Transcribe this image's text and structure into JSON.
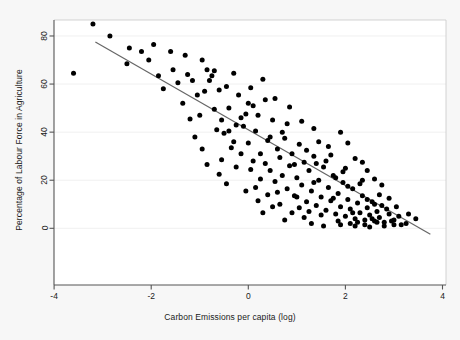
{
  "figure": {
    "background_color": "#f7f7f7",
    "plot_background_color": "#ffffff",
    "frame_color": "#555555",
    "point_color": "#000000",
    "line_color": "#666666",
    "gridline_color": "#f0f0f0"
  },
  "chart_data": {
    "type": "scatter",
    "title": "",
    "xlabel": "Carbon Emissions per capita (log)",
    "ylabel": "Percentage of Labour Force in Agriculture",
    "xlim": [
      -4.3,
      4.2
    ],
    "ylim": [
      -7,
      90
    ],
    "xticks": [
      -4,
      -2,
      0,
      2,
      4
    ],
    "xticklabels": [
      "-4",
      "-2",
      "0",
      "2",
      "4"
    ],
    "yticks": [
      0,
      20,
      40,
      60,
      80
    ],
    "yticklabels": [
      "0",
      "20",
      "40",
      "60",
      "80"
    ],
    "grid": "faint-horizontal",
    "legend": "none",
    "fit_line": {
      "type": "linear",
      "x": [
        -3.15,
        3.75
      ],
      "y": [
        77.5,
        -2.5
      ],
      "slope": -11.6,
      "intercept": 41.0
    },
    "points": [
      [
        -3.6,
        64.5
      ],
      [
        -3.2,
        85.0
      ],
      [
        -2.85,
        80.0
      ],
      [
        -2.45,
        75.0
      ],
      [
        -2.2,
        73.5
      ],
      [
        -2.05,
        70.0
      ],
      [
        -1.95,
        76.5
      ],
      [
        -1.85,
        63.5
      ],
      [
        -1.6,
        73.5
      ],
      [
        -1.55,
        66.0
      ],
      [
        -1.45,
        60.5
      ],
      [
        -1.3,
        72.0
      ],
      [
        -1.25,
        64.0
      ],
      [
        -1.15,
        61.5
      ],
      [
        -1.05,
        55.5
      ],
      [
        -0.95,
        70.0
      ],
      [
        -0.9,
        57.0
      ],
      [
        -0.85,
        66.0
      ],
      [
        -0.8,
        61.5
      ],
      [
        -0.75,
        63.5
      ],
      [
        -0.7,
        49.5
      ],
      [
        -0.65,
        41.0
      ],
      [
        -0.6,
        57.5
      ],
      [
        -0.55,
        45.0
      ],
      [
        -0.5,
        39.5
      ],
      [
        -0.45,
        59.0
      ],
      [
        -0.4,
        40.5
      ],
      [
        -0.35,
        33.5
      ],
      [
        -0.3,
        64.5
      ],
      [
        -0.25,
        43.0
      ],
      [
        -0.2,
        55.5
      ],
      [
        -0.15,
        31.0
      ],
      [
        -0.1,
        42.5
      ],
      [
        -0.05,
        47.5
      ],
      [
        0.0,
        35.5
      ],
      [
        0.05,
        58.5
      ],
      [
        0.1,
        28.0
      ],
      [
        0.15,
        40.5
      ],
      [
        0.2,
        47.0
      ],
      [
        0.25,
        31.0
      ],
      [
        0.3,
        62.0
      ],
      [
        0.35,
        27.0
      ],
      [
        0.4,
        36.5
      ],
      [
        0.45,
        24.0
      ],
      [
        0.5,
        45.0
      ],
      [
        0.55,
        19.5
      ],
      [
        0.6,
        33.0
      ],
      [
        0.65,
        29.5
      ],
      [
        0.7,
        22.0
      ],
      [
        0.75,
        37.5
      ],
      [
        0.8,
        16.5
      ],
      [
        0.85,
        26.0
      ],
      [
        0.9,
        31.0
      ],
      [
        0.95,
        13.5
      ],
      [
        1.0,
        21.0
      ],
      [
        1.05,
        35.0
      ],
      [
        1.1,
        18.0
      ],
      [
        1.15,
        27.5
      ],
      [
        1.2,
        11.0
      ],
      [
        1.25,
        24.0
      ],
      [
        1.3,
        15.5
      ],
      [
        1.35,
        30.0
      ],
      [
        1.4,
        9.5
      ],
      [
        1.45,
        20.0
      ],
      [
        1.5,
        13.0
      ],
      [
        1.55,
        25.5
      ],
      [
        1.6,
        7.5
      ],
      [
        1.65,
        17.0
      ],
      [
        1.7,
        11.5
      ],
      [
        1.75,
        22.0
      ],
      [
        1.8,
        6.0
      ],
      [
        1.85,
        14.5
      ],
      [
        1.9,
        9.0
      ],
      [
        1.95,
        19.0
      ],
      [
        2.0,
        5.0
      ],
      [
        2.05,
        12.0
      ],
      [
        2.1,
        8.0
      ],
      [
        2.15,
        16.5
      ],
      [
        2.2,
        4.0
      ],
      [
        2.25,
        10.5
      ],
      [
        2.3,
        6.5
      ],
      [
        2.35,
        13.5
      ],
      [
        2.4,
        3.5
      ],
      [
        2.45,
        8.5
      ],
      [
        2.5,
        5.5
      ],
      [
        2.55,
        11.0
      ],
      [
        2.6,
        3.0
      ],
      [
        2.65,
        7.0
      ],
      [
        2.7,
        4.5
      ],
      [
        2.75,
        9.5
      ],
      [
        2.8,
        2.5
      ],
      [
        2.9,
        6.0
      ],
      [
        3.0,
        3.5
      ],
      [
        3.1,
        5.0
      ],
      [
        3.25,
        2.0
      ],
      [
        3.45,
        4.0
      ],
      [
        -2.5,
        68.5
      ],
      [
        -1.75,
        58.0
      ],
      [
        -1.35,
        52.0
      ],
      [
        -1.0,
        47.0
      ],
      [
        -0.7,
        65.5
      ],
      [
        -0.55,
        28.5
      ],
      [
        -0.3,
        36.0
      ],
      [
        0.1,
        51.0
      ],
      [
        0.25,
        20.5
      ],
      [
        0.45,
        38.0
      ],
      [
        0.6,
        15.0
      ],
      [
        0.8,
        43.5
      ],
      [
        0.95,
        26.5
      ],
      [
        1.05,
        8.5
      ],
      [
        1.2,
        32.5
      ],
      [
        1.35,
        19.0
      ],
      [
        1.5,
        5.5
      ],
      [
        1.6,
        28.0
      ],
      [
        1.75,
        12.5
      ],
      [
        1.85,
        3.0
      ],
      [
        1.95,
        23.5
      ],
      [
        2.05,
        17.5
      ],
      [
        2.15,
        6.5
      ],
      [
        2.25,
        2.5
      ],
      [
        2.35,
        20.0
      ],
      [
        2.45,
        12.0
      ],
      [
        2.55,
        4.0
      ],
      [
        2.7,
        14.0
      ],
      [
        2.85,
        8.0
      ],
      [
        3.0,
        1.5
      ],
      [
        -0.95,
        33.0
      ],
      [
        -0.85,
        26.5
      ],
      [
        -0.15,
        46.0
      ],
      [
        0.35,
        53.5
      ],
      [
        0.7,
        40.0
      ],
      [
        1.1,
        44.5
      ],
      [
        1.45,
        36.0
      ],
      [
        1.7,
        30.5
      ],
      [
        2.0,
        25.0
      ],
      [
        2.3,
        18.5
      ],
      [
        2.6,
        10.0
      ],
      [
        1.3,
        2.0
      ],
      [
        1.55,
        1.0
      ],
      [
        1.9,
        1.5
      ],
      [
        2.1,
        2.0
      ],
      [
        2.2,
        1.0
      ],
      [
        2.4,
        1.5
      ],
      [
        2.5,
        0.5
      ],
      [
        2.65,
        2.5
      ],
      [
        2.8,
        1.0
      ],
      [
        2.95,
        3.0
      ],
      [
        3.15,
        1.5
      ],
      [
        -0.6,
        22.5
      ],
      [
        -0.45,
        18.5
      ],
      [
        -0.25,
        25.5
      ],
      [
        0.0,
        52.0
      ],
      [
        0.2,
        11.5
      ],
      [
        0.5,
        9.0
      ],
      [
        0.9,
        6.5
      ],
      [
        1.15,
        4.5
      ],
      [
        1.4,
        27.0
      ],
      [
        1.65,
        34.0
      ],
      [
        2.75,
        18.0
      ],
      [
        3.05,
        9.0
      ],
      [
        -1.2,
        45.5
      ],
      [
        -1.1,
        38.0
      ],
      [
        0.15,
        17.0
      ],
      [
        0.4,
        14.0
      ],
      [
        0.75,
        3.5
      ],
      [
        1.25,
        7.0
      ],
      [
        1.8,
        21.0
      ],
      [
        2.9,
        12.5
      ],
      [
        3.3,
        6.0
      ],
      [
        -0.4,
        50.0
      ],
      [
        0.05,
        24.5
      ],
      [
        0.55,
        54.0
      ],
      [
        0.85,
        50.5
      ],
      [
        1.0,
        13.0
      ],
      [
        2.45,
        24.0
      ],
      [
        2.6,
        20.5
      ],
      [
        1.9,
        40.0
      ],
      [
        2.05,
        35.5
      ],
      [
        1.35,
        41.5
      ],
      [
        0.3,
        6.5
      ],
      [
        -0.05,
        15.5
      ],
      [
        0.65,
        10.0
      ],
      [
        2.2,
        29.0
      ],
      [
        2.35,
        27.5
      ]
    ]
  }
}
